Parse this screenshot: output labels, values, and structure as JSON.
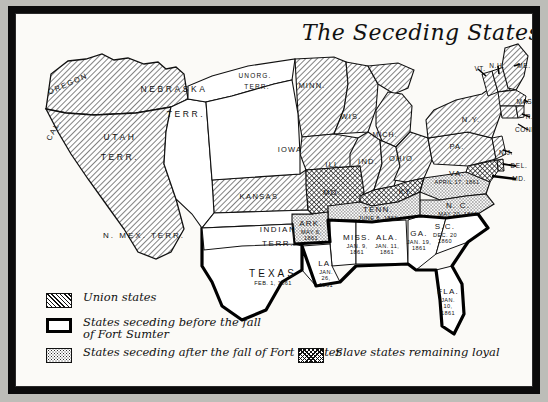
{
  "document": {
    "title": "The Seceding States",
    "type": "historical-map",
    "subject": "United States secession 1860-1861"
  },
  "legend": {
    "items": [
      {
        "id": "union",
        "label": "Union states",
        "pattern": "diagonal-hatch",
        "swatch_class": "hatch"
      },
      {
        "id": "seceded-before",
        "label": "States seceding before the fall\nof Fort Sumter",
        "pattern": "outline-white",
        "swatch_class": "plain"
      },
      {
        "id": "seceded-after",
        "label": "States seceding after the fall of Fort Sumter",
        "pattern": "stipple",
        "swatch_class": "stipple"
      },
      {
        "id": "slave-loyal",
        "label": "Slave states remaining loyal",
        "pattern": "cross-hatch",
        "swatch_class": "cross"
      }
    ]
  },
  "colors": {
    "ink": "#111111",
    "paper": "#fbfaf7",
    "frame": "#0b0b0b",
    "backdrop": "#bdbdb8"
  },
  "map_labels": {
    "union_states": [
      {
        "name": "OREGON",
        "x": 52,
        "y": 70,
        "rot": -24,
        "size": 7.5,
        "sp": 1.6
      },
      {
        "name": "CAL.",
        "x": 38,
        "y": 116,
        "rot": -62,
        "size": 7.5,
        "sp": 1.6
      },
      {
        "name": "MINN.",
        "x": 296,
        "y": 72,
        "rot": 0,
        "size": 7.5,
        "sp": 1.2
      },
      {
        "name": "WIS.",
        "x": 335,
        "y": 103,
        "rot": 0,
        "size": 7.5,
        "sp": 1.2
      },
      {
        "name": "IOWA",
        "x": 274,
        "y": 136,
        "rot": 0,
        "size": 7.5,
        "sp": 1.2
      },
      {
        "name": "ILL.",
        "x": 318,
        "y": 151,
        "rot": 0,
        "size": 7.5,
        "sp": 1.2
      },
      {
        "name": "IND.",
        "x": 352,
        "y": 148,
        "rot": 0,
        "size": 7.5,
        "sp": 1.2
      },
      {
        "name": "OHIO",
        "x": 385,
        "y": 145,
        "rot": 0,
        "size": 7.5,
        "sp": 1.2
      },
      {
        "name": "MICH.",
        "x": 369,
        "y": 120,
        "rot": 0,
        "size": 7,
        "sp": 1.0
      },
      {
        "name": "KANSAS",
        "x": 243,
        "y": 183,
        "rot": 0,
        "size": 7.5,
        "sp": 1.4
      },
      {
        "name": "PA.",
        "x": 441,
        "y": 133,
        "rot": 0,
        "size": 7.5,
        "sp": 1.2
      },
      {
        "name": "N.Y.",
        "x": 455,
        "y": 106,
        "rot": 0,
        "size": 7.5,
        "sp": 1.2
      }
    ],
    "new_england_callouts": [
      {
        "name": "VT.",
        "x": 464,
        "y": 55
      },
      {
        "name": "N.H.",
        "x": 481,
        "y": 52
      },
      {
        "name": "ME.",
        "x": 508,
        "y": 52
      },
      {
        "name": "MASS.",
        "x": 512,
        "y": 88
      },
      {
        "name": "R.I.",
        "x": 516,
        "y": 103
      },
      {
        "name": "CONN.",
        "x": 511,
        "y": 116
      },
      {
        "name": "N.J.",
        "x": 490,
        "y": 139
      },
      {
        "name": "DEL.",
        "x": 503,
        "y": 152
      },
      {
        "name": "MD.",
        "x": 503,
        "y": 165
      }
    ],
    "territories": [
      {
        "name": "NEBRASKA",
        "x": 158,
        "y": 75,
        "size": 8.5,
        "sp": 2.6
      },
      {
        "name": "TERR.",
        "x": 170,
        "y": 100,
        "size": 8.5,
        "sp": 2.6
      },
      {
        "name": "UNORG.",
        "x": 239,
        "y": 62,
        "size": 6.5,
        "sp": 1.2
      },
      {
        "name": "TERR.",
        "x": 241,
        "y": 73,
        "size": 6.5,
        "sp": 1.2
      },
      {
        "name": "UTAH",
        "x": 104,
        "y": 123,
        "size": 8.5,
        "sp": 2.6
      },
      {
        "name": "TERR.",
        "x": 104,
        "y": 143,
        "size": 8.5,
        "sp": 2.6
      },
      {
        "name": "N. MEX. TERR.",
        "x": 128,
        "y": 222,
        "size": 8,
        "sp": 2.0
      },
      {
        "name": "INDIAN",
        "x": 262,
        "y": 216,
        "size": 8,
        "sp": 1.6
      },
      {
        "name": "TERR.",
        "x": 262,
        "y": 230,
        "size": 8,
        "sp": 1.6
      }
    ],
    "seceded_before_sumter": [
      {
        "state": "S.C.",
        "date_lines": [
          "DEC. 20",
          "1860"
        ],
        "x": 429,
        "y": 219,
        "order": 1
      },
      {
        "state": "MISS.",
        "date_lines": [
          "JAN. 9,",
          "1861"
        ],
        "x": 341,
        "y": 230,
        "order": 2
      },
      {
        "state": "FLA.",
        "date_lines": [
          "JAN.",
          "10,",
          "1861"
        ],
        "x": 432,
        "y": 288,
        "order": 3
      },
      {
        "state": "ALA.",
        "date_lines": [
          "JAN. 11,",
          "1861"
        ],
        "x": 371,
        "y": 230,
        "order": 4
      },
      {
        "state": "GA.",
        "date_lines": [
          "JAN. 19,",
          "1861"
        ],
        "x": 403,
        "y": 226,
        "order": 5
      },
      {
        "state": "LA.",
        "date_lines": [
          "JAN.",
          "26,",
          "1861"
        ],
        "x": 310,
        "y": 260,
        "order": 6
      },
      {
        "state": "TEXAS",
        "date_lines": [
          "FEB. 1, 1861"
        ],
        "x": 257,
        "y": 263,
        "order": 7,
        "big": true
      }
    ],
    "seceded_after_sumter": [
      {
        "state": "VA.",
        "date_lines": [
          "APRIL 17, 1861"
        ],
        "x": 441,
        "y": 163,
        "order": 8
      },
      {
        "state": "ARK.",
        "date_lines": [
          "MAY 6,",
          "1861"
        ],
        "x": 295,
        "y": 216,
        "order": 9
      },
      {
        "state": "TENN.",
        "date_lines": [
          "JUNE 8, 1861"
        ],
        "x": 362,
        "y": 199,
        "order": 10
      },
      {
        "state": "N. C.",
        "date_lines": [
          "MAY 20, 1861"
        ],
        "x": 442,
        "y": 195,
        "order": 11
      }
    ],
    "slave_states_loyal": [
      {
        "state": "MO.",
        "x": 316,
        "y": 179
      },
      {
        "state": "KY.",
        "x": 390,
        "y": 178
      },
      {
        "state": "DEL.",
        "x": 0,
        "y": 0,
        "callout": true
      },
      {
        "state": "MD.",
        "x": 0,
        "y": 0,
        "callout": true
      }
    ]
  }
}
